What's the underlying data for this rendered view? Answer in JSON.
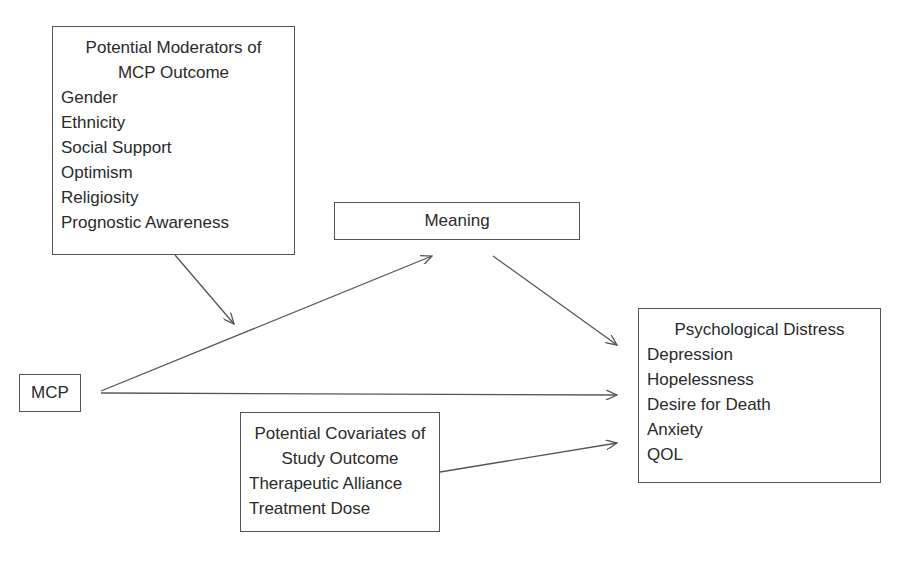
{
  "diagram": {
    "moderators": {
      "title_line1": "Potential Moderators of",
      "title_line2": "MCP Outcome",
      "items": [
        "Gender",
        "Ethnicity",
        "Social Support",
        "Optimism",
        "Religiosity",
        "Prognostic Awareness"
      ]
    },
    "meaning": {
      "label": "Meaning"
    },
    "mcp": {
      "label": "MCP"
    },
    "distress": {
      "title": "Psychological Distress",
      "items": [
        "Depression",
        "Hopelessness",
        "Desire for Death",
        "Anxiety",
        "QOL"
      ]
    },
    "covariates": {
      "title_line1": "Potential Covariates of",
      "title_line2": "Study Outcome",
      "items": [
        "Therapeutic Alliance",
        "Treatment Dose"
      ]
    },
    "arrows": [
      {
        "from": "moderators",
        "to": "MCP-Meaning path"
      },
      {
        "from": "MCP",
        "to": "Meaning"
      },
      {
        "from": "Meaning",
        "to": "Psychological Distress"
      },
      {
        "from": "MCP",
        "to": "Psychological Distress"
      },
      {
        "from": "covariates",
        "to": "Psychological Distress"
      }
    ]
  }
}
